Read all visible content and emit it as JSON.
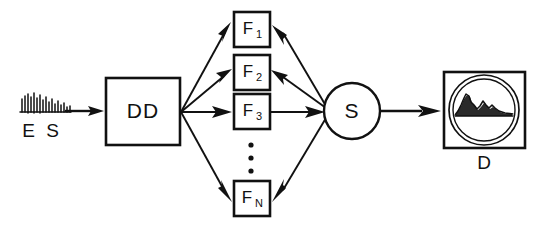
{
  "figure": {
    "type": "block-diagram",
    "background_color": "#ffffff",
    "line_color": "#111111"
  },
  "nodes": {
    "source": {
      "label": "E S",
      "icon": "damped-oscillation-waveform",
      "shape": "waveform-glyph"
    },
    "dd": {
      "label": "DD",
      "shape": "rectangle"
    },
    "filters": [
      {
        "label_main": "F",
        "label_sub": "1",
        "shape": "rectangle"
      },
      {
        "label_main": "F",
        "label_sub": "2",
        "shape": "rectangle"
      },
      {
        "label_main": "F",
        "label_sub": "3",
        "shape": "rectangle"
      },
      {
        "label_main": "F",
        "label_sub": "N",
        "shape": "rectangle"
      }
    ],
    "ellipsis": {
      "glyph": "vertical-ellipsis",
      "dot_count": 3
    },
    "summer": {
      "label": "S",
      "shape": "circle"
    },
    "display": {
      "label": "D",
      "shape": "rectangle-with-circular-screen",
      "screen_content": "spectrum-trace"
    }
  },
  "connections": [
    {
      "from": "source",
      "to": "dd",
      "arrow": "right"
    },
    {
      "from": "dd",
      "to": "F1",
      "arrow": "to-filter"
    },
    {
      "from": "dd",
      "to": "F2",
      "arrow": "to-filter"
    },
    {
      "from": "dd",
      "to": "F3",
      "arrow": "to-filter"
    },
    {
      "from": "dd",
      "to": "FN",
      "arrow": "to-filter"
    },
    {
      "from": "summer",
      "to": "F1",
      "arrow": "to-filter"
    },
    {
      "from": "summer",
      "to": "F2",
      "arrow": "to-filter"
    },
    {
      "from": "F3",
      "to": "summer",
      "arrow": "to-summer"
    },
    {
      "from": "summer",
      "to": "FN",
      "arrow": "to-filter"
    },
    {
      "from": "summer",
      "to": "display",
      "arrow": "right"
    }
  ]
}
